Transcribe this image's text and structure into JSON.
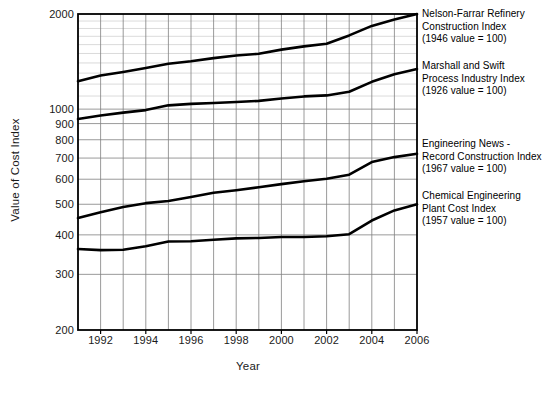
{
  "chart_data": {
    "type": "line",
    "title": "",
    "xlabel": "Year",
    "ylabel": "Value of Cost Index",
    "yscale": "log",
    "ylim": [
      200,
      2000
    ],
    "xlim": [
      1991,
      2006
    ],
    "grid": true,
    "legend_position": "right",
    "ytick_labels": [
      "2000",
      "1000",
      "900",
      "800",
      "700",
      "600",
      "500",
      "400",
      "300",
      "200"
    ],
    "ytick_values": [
      2000,
      1000,
      900,
      800,
      700,
      600,
      500,
      400,
      300,
      200
    ],
    "xtick_labels": [
      "1992",
      "1994",
      "1996",
      "1998",
      "2000",
      "2002",
      "2004",
      "2006"
    ],
    "xtick_values": [
      1992,
      1994,
      1996,
      1998,
      2000,
      2002,
      2004,
      2006
    ],
    "x": [
      1991,
      1992,
      1993,
      1994,
      1995,
      1996,
      1997,
      1998,
      1999,
      2000,
      2001,
      2002,
      2003,
      2004,
      2005,
      2006
    ],
    "series": [
      {
        "name": "Nelson-Farrar Refinery Construction Index",
        "basis": "(1946 value = 100)",
        "color": "#000000",
        "values": [
          1225,
          1277,
          1311,
          1349,
          1392,
          1418,
          1450,
          1478,
          1497,
          1543,
          1580,
          1610,
          1711,
          1834,
          1920,
          2000
        ]
      },
      {
        "name": "Marshall and Swift Process Industry Index",
        "basis": "(1926 value = 100)",
        "color": "#000000",
        "values": [
          930,
          955,
          975,
          993,
          1028,
          1039,
          1046,
          1053,
          1062,
          1080,
          1097,
          1105,
          1135,
          1220,
          1290,
          1340
        ]
      },
      {
        "name": "Engineering News - Record Construction Index",
        "basis": "(1967 value = 100)",
        "color": "#000000",
        "values": [
          452,
          472,
          490,
          504,
          512,
          527,
          544,
          554,
          566,
          579,
          591,
          602,
          620,
          680,
          705,
          722
        ]
      },
      {
        "name": "Chemical Engineering Plant Cost Index",
        "basis": "(1957 value = 100)",
        "color": "#000000",
        "values": [
          361,
          358,
          359,
          368,
          381,
          382,
          386,
          390,
          391,
          394,
          394,
          396,
          402,
          444,
          478,
          500
        ]
      }
    ]
  },
  "legend": {
    "entries": [
      {
        "line1": "Nelson-Farrar Refinery",
        "line2": "Construction Index",
        "line3": "(1946 value = 100)"
      },
      {
        "line1": "Marshall and Swift",
        "line2": "Process Industry Index",
        "line3": "(1926 value = 100)"
      },
      {
        "line1": "Engineering News -",
        "line2": "Record Construction Index",
        "line3": "(1967 value = 100)"
      },
      {
        "line1": "Chemical Engineering",
        "line2": "Plant Cost Index",
        "line3": "(1957 value = 100)"
      }
    ]
  },
  "axes": {
    "ylabel": "Value of Cost Index",
    "xlabel": "Year"
  }
}
